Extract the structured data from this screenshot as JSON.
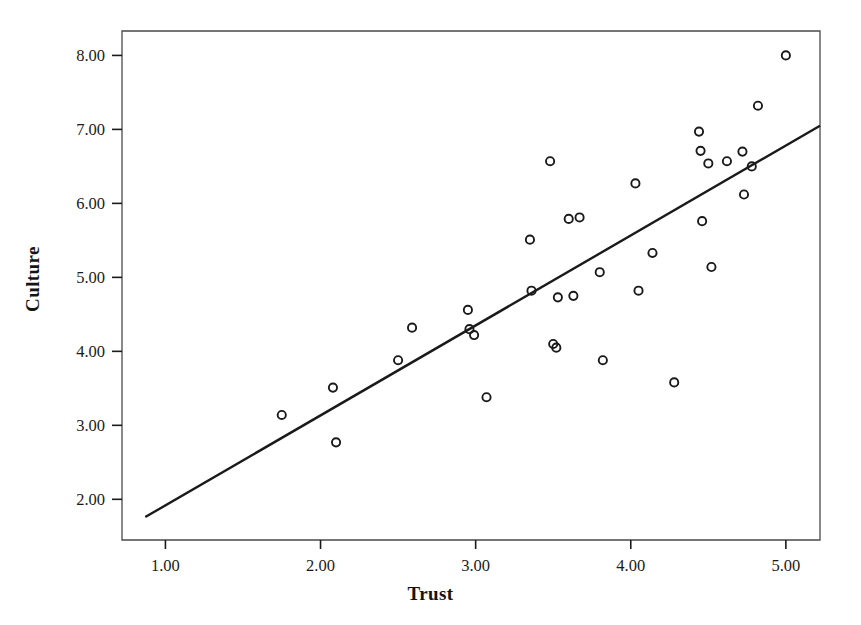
{
  "chart_data": {
    "type": "scatter",
    "title": "",
    "xlabel": "Trust",
    "ylabel": "Culture",
    "xlim": [
      0.72,
      5.22
    ],
    "ylim": [
      1.45,
      8.33
    ],
    "xticks": [
      "1.00",
      "2.00",
      "3.00",
      "4.00",
      "5.00"
    ],
    "xtick_values": [
      1,
      2,
      3,
      4,
      5
    ],
    "yticks": [
      "2.00",
      "3.00",
      "4.00",
      "5.00",
      "6.00",
      "7.00",
      "8.00"
    ],
    "ytick_values": [
      2,
      3,
      4,
      5,
      6,
      7,
      8
    ],
    "grid": false,
    "legend": null,
    "marker": "open-circle",
    "marker_color": "#1a1a1a",
    "line_color": "#1a1a1a",
    "points": [
      {
        "x": 1.75,
        "y": 3.14
      },
      {
        "x": 2.08,
        "y": 3.51
      },
      {
        "x": 2.1,
        "y": 2.77
      },
      {
        "x": 2.5,
        "y": 3.88
      },
      {
        "x": 2.59,
        "y": 4.32
      },
      {
        "x": 2.95,
        "y": 4.56
      },
      {
        "x": 2.96,
        "y": 4.3
      },
      {
        "x": 2.99,
        "y": 4.22
      },
      {
        "x": 3.07,
        "y": 3.38
      },
      {
        "x": 3.35,
        "y": 5.51
      },
      {
        "x": 3.36,
        "y": 4.82
      },
      {
        "x": 3.48,
        "y": 6.57
      },
      {
        "x": 3.5,
        "y": 4.1
      },
      {
        "x": 3.52,
        "y": 4.05
      },
      {
        "x": 3.53,
        "y": 4.73
      },
      {
        "x": 3.6,
        "y": 5.79
      },
      {
        "x": 3.63,
        "y": 4.75
      },
      {
        "x": 3.67,
        "y": 5.81
      },
      {
        "x": 3.8,
        "y": 5.07
      },
      {
        "x": 3.82,
        "y": 3.88
      },
      {
        "x": 4.03,
        "y": 6.27
      },
      {
        "x": 4.05,
        "y": 4.82
      },
      {
        "x": 4.14,
        "y": 5.33
      },
      {
        "x": 4.28,
        "y": 3.58
      },
      {
        "x": 4.44,
        "y": 6.97
      },
      {
        "x": 4.45,
        "y": 6.71
      },
      {
        "x": 4.46,
        "y": 5.76
      },
      {
        "x": 4.5,
        "y": 6.54
      },
      {
        "x": 4.52,
        "y": 5.14
      },
      {
        "x": 4.62,
        "y": 6.57
      },
      {
        "x": 4.72,
        "y": 6.7
      },
      {
        "x": 4.73,
        "y": 6.12
      },
      {
        "x": 4.78,
        "y": 6.5
      },
      {
        "x": 4.82,
        "y": 7.32
      },
      {
        "x": 5.0,
        "y": 8.0
      }
    ],
    "fit_line": {
      "type": "linear-regression",
      "x_start": 0.87,
      "y_start": 1.76,
      "x_end": 5.22,
      "y_end": 7.05
    }
  }
}
